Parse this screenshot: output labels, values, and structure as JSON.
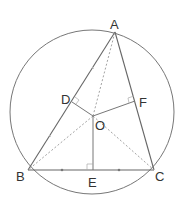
{
  "diagram": {
    "type": "geometry",
    "colors": {
      "stroke": "#666666",
      "dashed": "#999999",
      "label": "#333333",
      "background": "#ffffff"
    },
    "circle": {
      "cx": 92,
      "cy": 112,
      "r": 82
    },
    "points": {
      "A": {
        "label": "A",
        "x": 115,
        "y": 32
      },
      "B": {
        "label": "B",
        "x": 28,
        "y": 170
      },
      "C": {
        "label": "C",
        "x": 154,
        "y": 170
      },
      "O": {
        "label": "O",
        "x": 93,
        "y": 116
      },
      "D": {
        "label": "D",
        "x": 72,
        "y": 102
      },
      "E": {
        "label": "E",
        "x": 93,
        "y": 170
      },
      "F": {
        "label": "F",
        "x": 135,
        "y": 101
      }
    },
    "solid_segments": [
      "AB",
      "BC",
      "CA",
      "OD",
      "OE",
      "OF"
    ],
    "dashed_segments": [
      "OA",
      "OB",
      "OC"
    ],
    "right_angle_marks": [
      "D",
      "E",
      "F"
    ],
    "equal_tick_marks": [
      "BE",
      "EC"
    ]
  }
}
